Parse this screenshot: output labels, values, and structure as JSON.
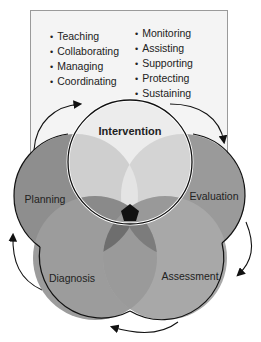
{
  "box": {
    "left_items": [
      "Teaching",
      "Collaborating",
      "Managing",
      "Coordinating"
    ],
    "right_items": [
      "Monitoring",
      "Assisting",
      "Supporting",
      "Protecting",
      "Sustaining"
    ]
  },
  "diagram": {
    "circles": [
      {
        "name": "Intervention",
        "color": "#e8e8e8"
      },
      {
        "name": "Evaluation",
        "color": "#9a9a9a"
      },
      {
        "name": "Assessment",
        "color": "#a8a8a8"
      },
      {
        "name": "Diagnosis",
        "color": "#9c9c9c"
      },
      {
        "name": "Planning",
        "color": "#8e8e8e"
      }
    ],
    "center_color": "#111111"
  }
}
